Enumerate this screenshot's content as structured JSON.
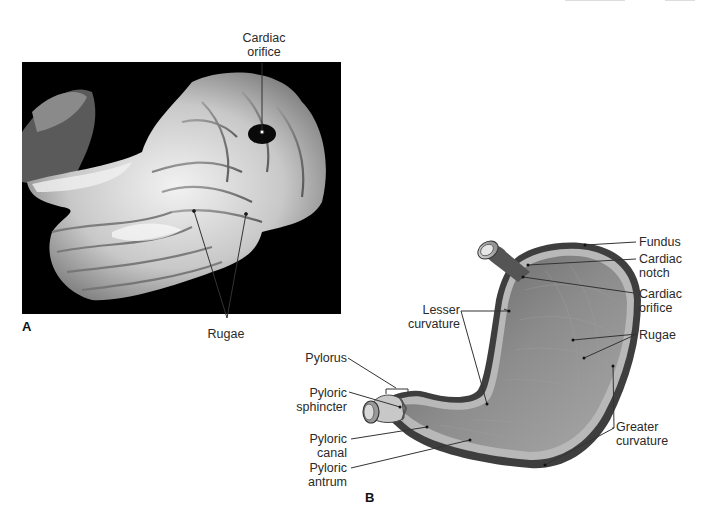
{
  "figure": {
    "panel_a": {
      "letter": "A",
      "description": "Photograph of opened stomach showing internal mucosal folds",
      "labels": {
        "cardiac_orifice_line1": "Cardiac",
        "cardiac_orifice_line2": "orifice",
        "rugae": "Rugae"
      }
    },
    "panel_b": {
      "letter": "B",
      "description": "Illustration of stomach cross-section",
      "labels": {
        "fundus": "Fundus",
        "cardiac_notch_line1": "Cardiac",
        "cardiac_notch_line2": "notch",
        "cardiac_orifice_line1": "Cardiac",
        "cardiac_orifice_line2": "orifice",
        "rugae": "Rugae",
        "greater_curvature_line1": "Greater",
        "greater_curvature_line2": "curvature",
        "lesser_curvature_line1": "Lesser",
        "lesser_curvature_line2": "curvature",
        "pylorus": "Pylorus",
        "pyloric_sphincter_line1": "Pyloric",
        "pyloric_sphincter_line2": "sphincter",
        "pyloric_canal_line1": "Pyloric",
        "pyloric_canal_line2": "canal",
        "pyloric_antrum_line1": "Pyloric",
        "pyloric_antrum_line2": "antrum"
      }
    }
  },
  "colors": {
    "photo_bg": "#000000",
    "stomach_tissue": "#d9d9d9",
    "diagram_fill": "#8c8c8c",
    "diagram_wall": "#bdbdbd",
    "leader_line": "#333333"
  }
}
